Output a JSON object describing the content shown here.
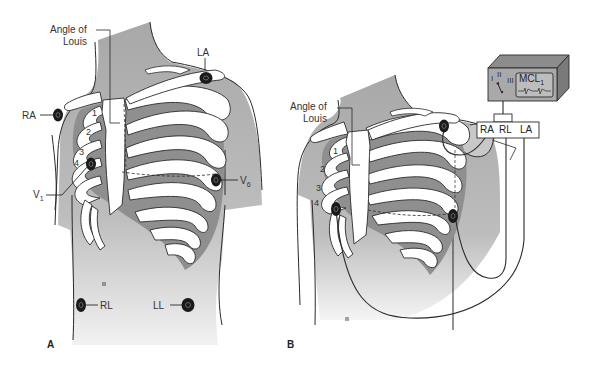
{
  "figure": {
    "panels": [
      {
        "id": "A",
        "letter": "A",
        "labels": {
          "angle_of_louis_line1": "Angle of",
          "angle_of_louis_line2": "Louis",
          "ra": "RA",
          "la": "LA",
          "v1": "V",
          "v1_sub": "1",
          "v6": "V",
          "v6_sub": "6",
          "rl": "RL",
          "ll": "LL"
        },
        "rib_numbers": [
          "1",
          "2",
          "3",
          "4"
        ]
      },
      {
        "id": "B",
        "letter": "B",
        "labels": {
          "angle_of_louis_line1": "Angle of",
          "angle_of_louis_line2": "Louis"
        },
        "rib_numbers": [
          "1",
          "2",
          "3",
          "4"
        ],
        "monitor": {
          "switch_positions": [
            "I",
            "II",
            "III"
          ],
          "selected_lead": "II",
          "display_label": "MCL",
          "display_label_sub": "1"
        },
        "lead_box": {
          "ra": "RA",
          "rl": "RL",
          "la": "LA"
        }
      }
    ],
    "colors": {
      "skin": "#b4b4b4",
      "skin_light": "#d8d8d8",
      "bone": "#ffffff",
      "intercostal": "#8f8f8f",
      "outline": "#2a2a2a",
      "electrode": "#1a1a1a",
      "monitor": "#a9a9a9"
    }
  }
}
